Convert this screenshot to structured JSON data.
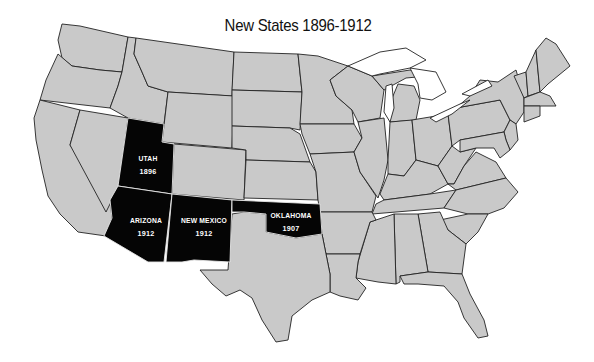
{
  "title": "New States 1896-1912",
  "colors": {
    "background": "#ffffff",
    "existing_state_fill": "#c9c9c9",
    "new_state_fill": "#050505",
    "border": "#222222",
    "label_text": "#ffffff"
  },
  "highlighted_states": [
    {
      "name": "UTAH",
      "year": "1896"
    },
    {
      "name": "ARIZONA",
      "year": "1912"
    },
    {
      "name": "NEW MEXICO",
      "year": "1912"
    },
    {
      "name": "OKLAHOMA",
      "year": "1907"
    }
  ],
  "legend": null
}
